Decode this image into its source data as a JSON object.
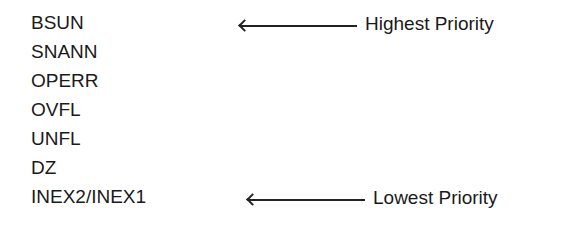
{
  "priority_list": {
    "items": [
      "BSUN",
      "SNANN",
      "OPERR",
      "OVFL",
      "UNFL",
      "DZ",
      "INEX2/INEX1"
    ],
    "annotations": {
      "highest": {
        "label": "Highest Priority",
        "icon": "left-arrow-icon"
      },
      "lowest": {
        "label": "Lowest Priority",
        "icon": "left-arrow-icon"
      }
    }
  }
}
